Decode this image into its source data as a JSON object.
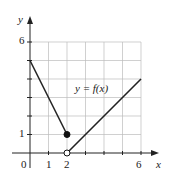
{
  "chart_data": {
    "type": "line",
    "title": "",
    "function_label": "y = f(x)",
    "xlabel": "x",
    "ylabel": "y",
    "xlim": [
      0,
      6
    ],
    "ylim": [
      0,
      6
    ],
    "x_ticks_labeled": [
      "0",
      "1",
      "2",
      "6"
    ],
    "y_ticks_labeled": [
      "1",
      "6"
    ],
    "grid": true,
    "series": [
      {
        "name": "left piece",
        "points": [
          [
            0,
            5
          ],
          [
            2,
            1
          ]
        ],
        "endpoint": {
          "x": 2,
          "y": 1,
          "closed": true
        }
      },
      {
        "name": "right piece",
        "points": [
          [
            2,
            0
          ],
          [
            6,
            4
          ]
        ],
        "endpoint": {
          "x": 2,
          "y": 0,
          "closed": false
        }
      }
    ]
  },
  "labels": {
    "y_axis": "y",
    "x_axis": "x",
    "origin": "0",
    "x1": "1",
    "x2": "2",
    "x6": "6",
    "y1": "1",
    "y6": "6",
    "func": "y = f(x)"
  }
}
